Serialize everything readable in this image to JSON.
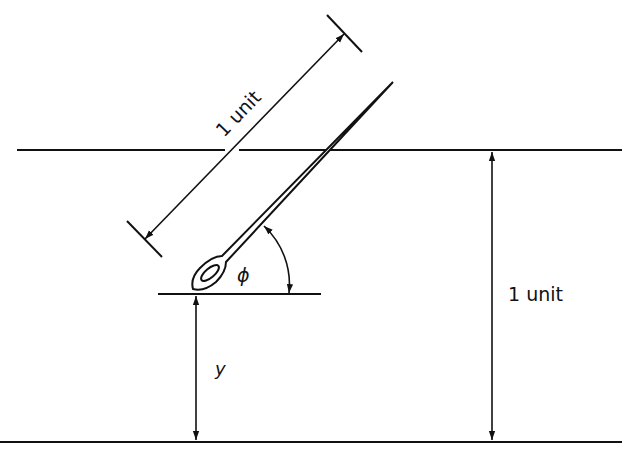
{
  "diagram": {
    "needle_length_label": "1 unit",
    "line_spacing_label": "1 unit",
    "angle_label": "ϕ",
    "distance_label": "y",
    "colors": {
      "ink": "#111111",
      "background": "#ffffff"
    }
  }
}
